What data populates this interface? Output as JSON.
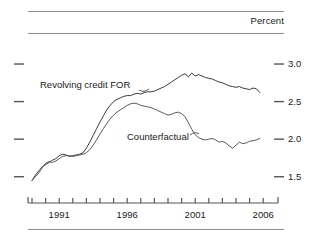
{
  "chart_data": {
    "type": "line",
    "title": "",
    "subtitle": "",
    "unit_label": "Percent",
    "xlabel": "",
    "ylabel": "",
    "grid": false,
    "legend_position": "inline-annotations",
    "xlim": [
      1989.0,
      2006.5
    ],
    "ylim": [
      1.35,
      3.12
    ],
    "yticks": [
      1.5,
      2.0,
      2.5,
      3.0
    ],
    "ytick_labels": [
      "1.5",
      "2.0",
      "2.5",
      "3.0"
    ],
    "xticks": [
      1989,
      1990,
      1991,
      1992,
      1993,
      1994,
      1995,
      1996,
      1997,
      1998,
      1999,
      2000,
      2001,
      2002,
      2003,
      2004,
      2005,
      2006
    ],
    "xtick_labels_shown": [
      "1991",
      "1996",
      "2001",
      "2006"
    ],
    "xtick_label_values": [
      1991,
      1996,
      2001,
      2006
    ],
    "series": [
      {
        "name": "Revolving credit FOR",
        "color": "#3a3a3a",
        "x": [
          1989.0,
          1989.25,
          1989.5,
          1989.75,
          1990.0,
          1990.25,
          1990.5,
          1990.75,
          1991.0,
          1991.25,
          1991.5,
          1991.75,
          1992.0,
          1992.25,
          1992.5,
          1992.75,
          1993.0,
          1993.25,
          1993.5,
          1993.75,
          1994.0,
          1994.25,
          1994.5,
          1994.75,
          1995.0,
          1995.25,
          1995.5,
          1995.75,
          1996.0,
          1996.25,
          1996.5,
          1996.75,
          1997.0,
          1997.25,
          1997.5,
          1997.75,
          1998.0,
          1998.25,
          1998.5,
          1998.75,
          1999.0,
          1999.25,
          1999.5,
          1999.75,
          2000.0,
          2000.25,
          2000.5,
          2000.75,
          2001.0,
          2001.25,
          2001.5,
          2001.75,
          2002.0,
          2002.25,
          2002.5,
          2002.75,
          2003.0,
          2003.25,
          2003.5,
          2003.75,
          2004.0,
          2004.25,
          2004.5,
          2004.75,
          2005.0,
          2005.25,
          2005.5,
          2005.75
        ],
        "y": [
          1.45,
          1.52,
          1.58,
          1.63,
          1.66,
          1.69,
          1.72,
          1.74,
          1.78,
          1.8,
          1.79,
          1.77,
          1.78,
          1.79,
          1.8,
          1.82,
          1.88,
          1.96,
          2.05,
          2.14,
          2.23,
          2.31,
          2.39,
          2.45,
          2.5,
          2.53,
          2.55,
          2.57,
          2.58,
          2.58,
          2.6,
          2.61,
          2.6,
          2.62,
          2.63,
          2.63,
          2.64,
          2.66,
          2.68,
          2.7,
          2.73,
          2.76,
          2.79,
          2.82,
          2.85,
          2.87,
          2.83,
          2.88,
          2.84,
          2.86,
          2.84,
          2.82,
          2.81,
          2.8,
          2.78,
          2.76,
          2.75,
          2.73,
          2.71,
          2.7,
          2.69,
          2.7,
          2.68,
          2.67,
          2.66,
          2.68,
          2.67,
          2.62
        ]
      },
      {
        "name": "Counterfactual",
        "color": "#5a5a5a",
        "x": [
          1989.0,
          1989.25,
          1989.5,
          1989.75,
          1990.0,
          1990.25,
          1990.5,
          1990.75,
          1991.0,
          1991.25,
          1991.5,
          1991.75,
          1992.0,
          1992.25,
          1992.5,
          1992.75,
          1993.0,
          1993.25,
          1993.5,
          1993.75,
          1994.0,
          1994.25,
          1994.5,
          1994.75,
          1995.0,
          1995.25,
          1995.5,
          1995.75,
          1996.0,
          1996.25,
          1996.5,
          1996.75,
          1997.0,
          1997.25,
          1997.5,
          1997.75,
          1998.0,
          1998.25,
          1998.5,
          1998.75,
          1999.0,
          1999.25,
          1999.5,
          1999.75,
          2000.0,
          2000.25,
          2000.5,
          2000.75,
          2001.0,
          2001.25,
          2001.5,
          2001.75,
          2002.0,
          2002.25,
          2002.5,
          2002.75,
          2003.0,
          2003.25,
          2003.5,
          2003.75,
          2004.0,
          2004.25,
          2004.5,
          2004.75,
          2005.0,
          2005.25,
          2005.5,
          2005.75
        ],
        "y": [
          1.45,
          1.5,
          1.55,
          1.62,
          1.68,
          1.7,
          1.69,
          1.71,
          1.74,
          1.77,
          1.78,
          1.78,
          1.77,
          1.78,
          1.79,
          1.8,
          1.82,
          1.86,
          1.92,
          1.99,
          2.07,
          2.14,
          2.21,
          2.27,
          2.32,
          2.36,
          2.39,
          2.42,
          2.45,
          2.47,
          2.48,
          2.47,
          2.45,
          2.44,
          2.43,
          2.42,
          2.4,
          2.38,
          2.36,
          2.34,
          2.32,
          2.33,
          2.35,
          2.36,
          2.34,
          2.3,
          2.22,
          2.13,
          2.06,
          2.02,
          2.0,
          1.99,
          2.0,
          2.01,
          1.99,
          1.96,
          1.97,
          1.95,
          1.91,
          1.88,
          1.92,
          1.96,
          1.94,
          1.95,
          1.97,
          1.98,
          1.99,
          2.01
        ]
      }
    ],
    "annotations": [
      {
        "name": "revolving-credit-label",
        "text": "Revolving credit FOR"
      },
      {
        "name": "counterfactual-label",
        "text": "Counterfactual"
      }
    ]
  }
}
